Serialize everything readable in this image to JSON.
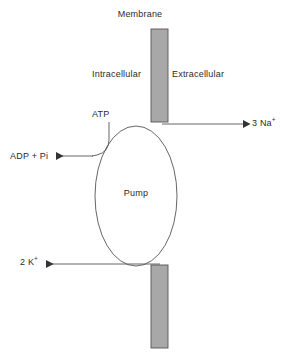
{
  "diagram": {
    "labels": {
      "membrane": "Membrane",
      "intracellular": "Intracellular",
      "extracellular": "Extracellular",
      "atp": "ATP",
      "adp_pi": "ADP + Pi",
      "sodium_out": "3 Na",
      "sodium_charge": "+",
      "potassium_in": "2 K",
      "potassium_charge": "+",
      "pump": "Pump"
    },
    "colors": {
      "membrane_fill": "#a8a8a8",
      "membrane_stroke": "#555555",
      "line_stroke": "#555555",
      "text": "#2b2b2b",
      "background": "#ffffff"
    },
    "geometry": {
      "membrane_top_bar": {
        "x": 151,
        "y": 29,
        "width": 17,
        "height": 93
      },
      "membrane_bottom_bar": {
        "x": 151,
        "y": 265,
        "width": 17,
        "height": 83
      },
      "pump_ellipse": {
        "cx": 136,
        "cy": 196,
        "rx": 41,
        "ry": 70
      }
    },
    "arrows": [
      {
        "name": "sodium-efflux-arrow",
        "from": "pump",
        "to": "3 Na+",
        "direction": "right"
      },
      {
        "name": "potassium-influx-arrow",
        "from": "membrane",
        "to": "2 K+",
        "direction": "left"
      },
      {
        "name": "atp-hydrolysis-arrow",
        "from": "ATP",
        "to": "ADP + Pi",
        "direction": "left"
      }
    ]
  }
}
